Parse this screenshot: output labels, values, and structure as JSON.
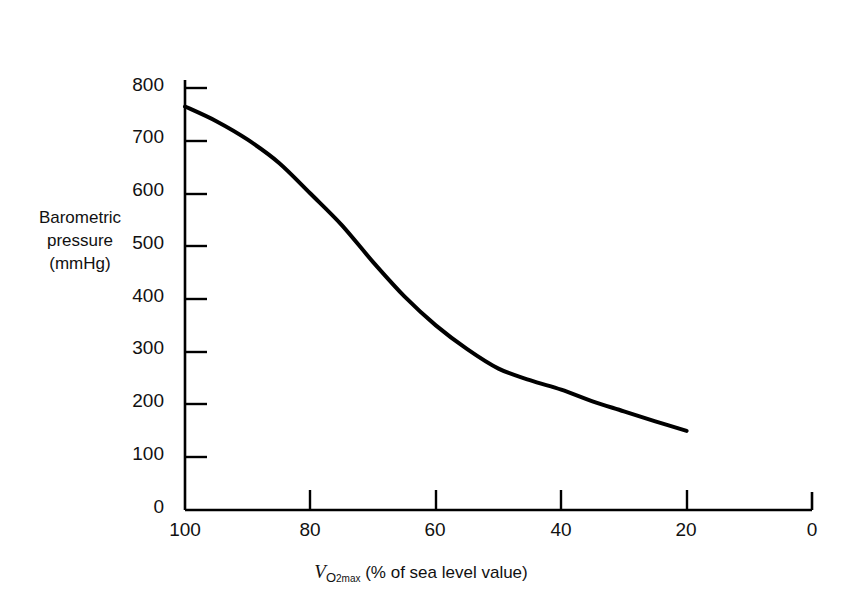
{
  "chart_data": {
    "type": "line",
    "title": "",
    "xlabel": "VO2max (% of sea level value)",
    "ylabel": "Barometric pressure (mmHg)",
    "ylabel_lines": [
      "Barometric",
      "pressure",
      "(mmHg)"
    ],
    "xlabel_parts": {
      "v": "V",
      "subscript": "O",
      "subscript_number": "2",
      "subscript_max": "max",
      "rest": "(% of sea level value)"
    },
    "x_ticks": [
      "100",
      "80",
      "60",
      "40",
      "20",
      "0"
    ],
    "x_tick_values": [
      100,
      80,
      60,
      40,
      20,
      0
    ],
    "y_ticks": [
      "0",
      "100",
      "200",
      "300",
      "400",
      "500",
      "600",
      "700",
      "800"
    ],
    "y_tick_values": [
      0,
      100,
      200,
      300,
      400,
      500,
      600,
      700,
      800
    ],
    "xlim": [
      100,
      0
    ],
    "ylim": [
      0,
      800
    ],
    "x_axis_reversed": true,
    "grid": false,
    "legend": "none",
    "series": [
      {
        "name": "Barometric pressure vs VO2max",
        "x": [
          100,
          95,
          90,
          85,
          80,
          75,
          70,
          65,
          60,
          55,
          50,
          45,
          40,
          35,
          30,
          25,
          20
        ],
        "values": [
          765,
          737,
          702,
          658,
          600,
          540,
          470,
          405,
          350,
          305,
          268,
          246,
          228,
          206,
          187,
          168,
          150
        ]
      }
    ],
    "line_color": "#000000",
    "line_width": 4,
    "axis_color": "#000000"
  },
  "figure": {
    "background": "#ffffff"
  }
}
